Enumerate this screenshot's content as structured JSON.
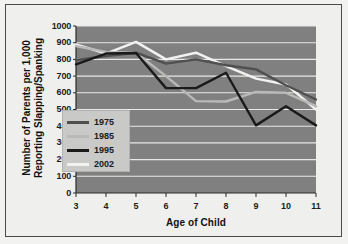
{
  "chart_data": {
    "type": "line",
    "title": "",
    "xlabel": "Age of Child",
    "ylabel": "Number of Parents per 1,000 Reporting Slapping/Spanking",
    "x": [
      3,
      4,
      5,
      6,
      7,
      8,
      9,
      10,
      11
    ],
    "xtick_labels": [
      "3",
      "4",
      "5",
      "6",
      "7",
      "8",
      "9",
      "10",
      "11"
    ],
    "ytick_labels": [
      "0",
      "100",
      "200",
      "300",
      "400",
      "500",
      "600",
      "700",
      "800",
      "900",
      "1000"
    ],
    "ytick_values": [
      0,
      100,
      200,
      300,
      400,
      500,
      600,
      700,
      800,
      900,
      1000
    ],
    "ylim": [
      0,
      1000
    ],
    "xlim": [
      3,
      11
    ],
    "grid": "horizontal",
    "legend_position": "inside-left",
    "plot_background": "#808080",
    "gridline_color": "#e8e8e6",
    "series": [
      {
        "name": "1975",
        "color": "#4f4f4f",
        "values": [
          795,
          820,
          840,
          775,
          800,
          765,
          740,
          645,
          560
        ]
      },
      {
        "name": "1985",
        "color": "#b9b9b7",
        "values": [
          880,
          845,
          840,
          700,
          550,
          548,
          605,
          600,
          520
        ]
      },
      {
        "name": "1995",
        "color": "#1a1a1a",
        "values": [
          770,
          835,
          838,
          628,
          628,
          720,
          405,
          520,
          405
        ]
      },
      {
        "name": "2002",
        "color": "#f2f2f0",
        "values": [
          890,
          835,
          905,
          800,
          840,
          760,
          685,
          650,
          500
        ]
      }
    ]
  },
  "legend": {
    "entries": [
      {
        "label": "1975",
        "color": "#4f4f4f"
      },
      {
        "label": "1985",
        "color": "#b9b9b7"
      },
      {
        "label": "1995",
        "color": "#1a1a1a"
      },
      {
        "label": "2002",
        "color": "#f2f2f0"
      }
    ]
  }
}
